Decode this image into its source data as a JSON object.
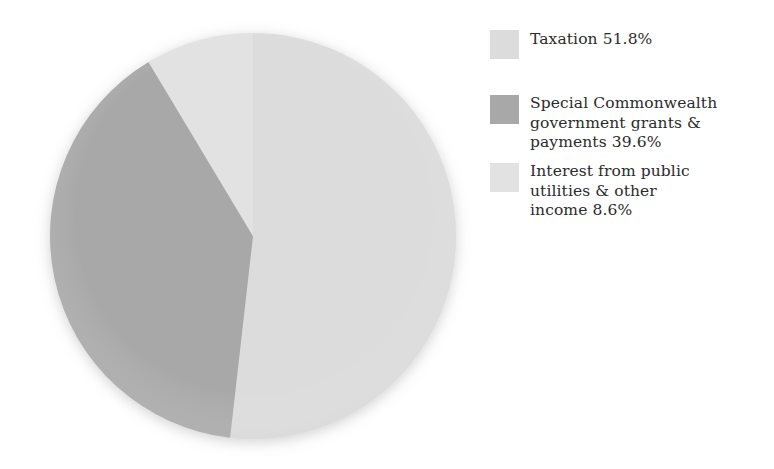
{
  "chart_data": {
    "type": "pie",
    "title": "",
    "subtitle": "",
    "xlabel": "",
    "ylabel": "",
    "legend_position": "right",
    "grid": false,
    "start_angle_deg": 0,
    "direction": "clockwise",
    "units": "percent",
    "total": 100.0,
    "categories": [
      "Taxation",
      "Special Commonwealth government grants & payments",
      "Interest from public utilities & other income"
    ],
    "values": [
      51.8,
      39.6,
      8.6
    ],
    "labels": [
      "Taxation 51.8%",
      "Special Commonwealth government grants & payments 39.6%",
      "Interest from public utilities & other income 8.6%"
    ],
    "colors": [
      "#dcdcdc",
      "#a8a8a8",
      "#e2e2e2"
    ],
    "slices": [
      {
        "name": "Taxation",
        "value": 51.8,
        "value_text": "51.8%",
        "color": "#dcdcdc",
        "start_deg": 0,
        "sweep_deg": 186.48
      },
      {
        "name": "Special Commonwealth government grants & payments",
        "value": 39.6,
        "value_text": "39.6%",
        "color": "#a8a8a8",
        "start_deg": 186.48,
        "sweep_deg": 142.56
      },
      {
        "name": "Interest from public utilities & other income",
        "value": 8.6,
        "value_text": "8.6%",
        "color": "#e2e2e2",
        "start_deg": 329.04,
        "sweep_deg": 30.96
      }
    ]
  },
  "pie": {
    "center_x": 253,
    "center_y": 236,
    "radius": 203
  },
  "legend": {
    "items": [
      {
        "label": "Taxation 51.8%",
        "swatch_color": "#dcdcdc",
        "swatch_name": "legend-swatch-taxation"
      },
      {
        "label": "Special Commonwealth\ngovernment grants &\npayments 39.6%",
        "swatch_color": "#a8a8a8",
        "swatch_name": "legend-swatch-special-commonwealth-grants"
      },
      {
        "label": "Interest from public\nutilities & other\nincome 8.6%",
        "swatch_color": "#e2e2e2",
        "swatch_name": "legend-swatch-interest-public-utilities"
      }
    ]
  }
}
